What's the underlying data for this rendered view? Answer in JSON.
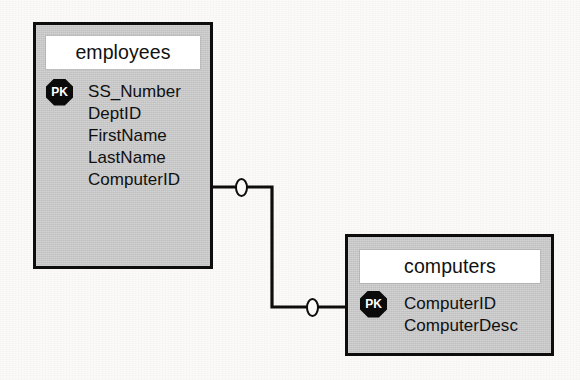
{
  "diagram": {
    "notation": "crow's-foot / IDEF1X-style relationship",
    "background_color": "#fbfaf8",
    "entity_fill_color": "#c9c9c9",
    "entity_border_color": "#0d0d0d",
    "key_badge_color": "#0b0b0b",
    "key_badge_text_color": "#ffffff",
    "entities": [
      {
        "id": "employees",
        "title": "employees",
        "fields": [
          {
            "key": "PK",
            "name": "SS_Number"
          },
          {
            "key": "",
            "name": "DeptID"
          },
          {
            "key": "",
            "name": "FirstName"
          },
          {
            "key": "",
            "name": "LastName"
          },
          {
            "key": "",
            "name": "ComputerID"
          }
        ]
      },
      {
        "id": "computers",
        "title": "computers",
        "fields": [
          {
            "key": "PK",
            "name": "ComputerID"
          },
          {
            "key": "",
            "name": "ComputerDesc"
          }
        ]
      }
    ],
    "relationship": {
      "from_entity": "employees",
      "from_field": "ComputerID",
      "to_entity": "computers",
      "to_field": "ComputerID",
      "from_cardinality": "0",
      "to_cardinality": "0",
      "line_style": "orthogonal"
    }
  }
}
